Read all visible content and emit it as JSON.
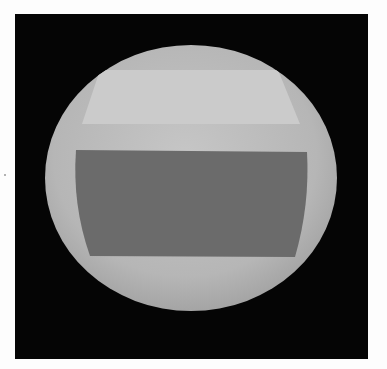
{
  "image": {
    "description": "Rendered shaded sphere with two horizontal bands on black background",
    "background_color": "#050505",
    "page_color": "#fdfdfd",
    "sphere": {
      "center": [
        191,
        178
      ],
      "rx": 146,
      "ry": 133,
      "color_center": "#c4c4c4",
      "color_edge": "#a8a8a8"
    },
    "light_band": {
      "color": "#cbcbcb",
      "points": "100,70 278,70 300,124 82,124"
    },
    "dark_band": {
      "color": "#6b6b6b",
      "path": "M76,150 L307,152 Q310,205 295,257 L90,256 Q72,205 76,150 Z"
    }
  }
}
